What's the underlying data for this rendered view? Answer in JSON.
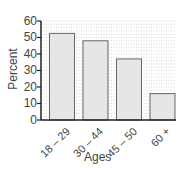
{
  "chart_data": {
    "type": "bar",
    "title": "",
    "xlabel": "Ages",
    "ylabel": "Percent",
    "categories": [
      "18 – 29",
      "30 – 44",
      "45 – 50",
      "60 +"
    ],
    "values": [
      52.5,
      48,
      37,
      16
    ],
    "ylim": [
      0,
      60
    ],
    "yticks": [
      0,
      10,
      20,
      30,
      40,
      50,
      60
    ],
    "grid": true,
    "legend": null,
    "colors": {
      "bar_fill": "#e6e6e6",
      "bar_stroke": "#666666",
      "grid": "#bbbbbb",
      "axis": "#222222"
    }
  },
  "axes": {
    "xlabel": "Ages",
    "ylabel": "Percent",
    "yticks": [
      "0",
      "10",
      "20",
      "30",
      "40",
      "50",
      "60"
    ],
    "xticks": [
      "18 – 29",
      "30 – 44",
      "45 – 50",
      "60 +"
    ]
  }
}
